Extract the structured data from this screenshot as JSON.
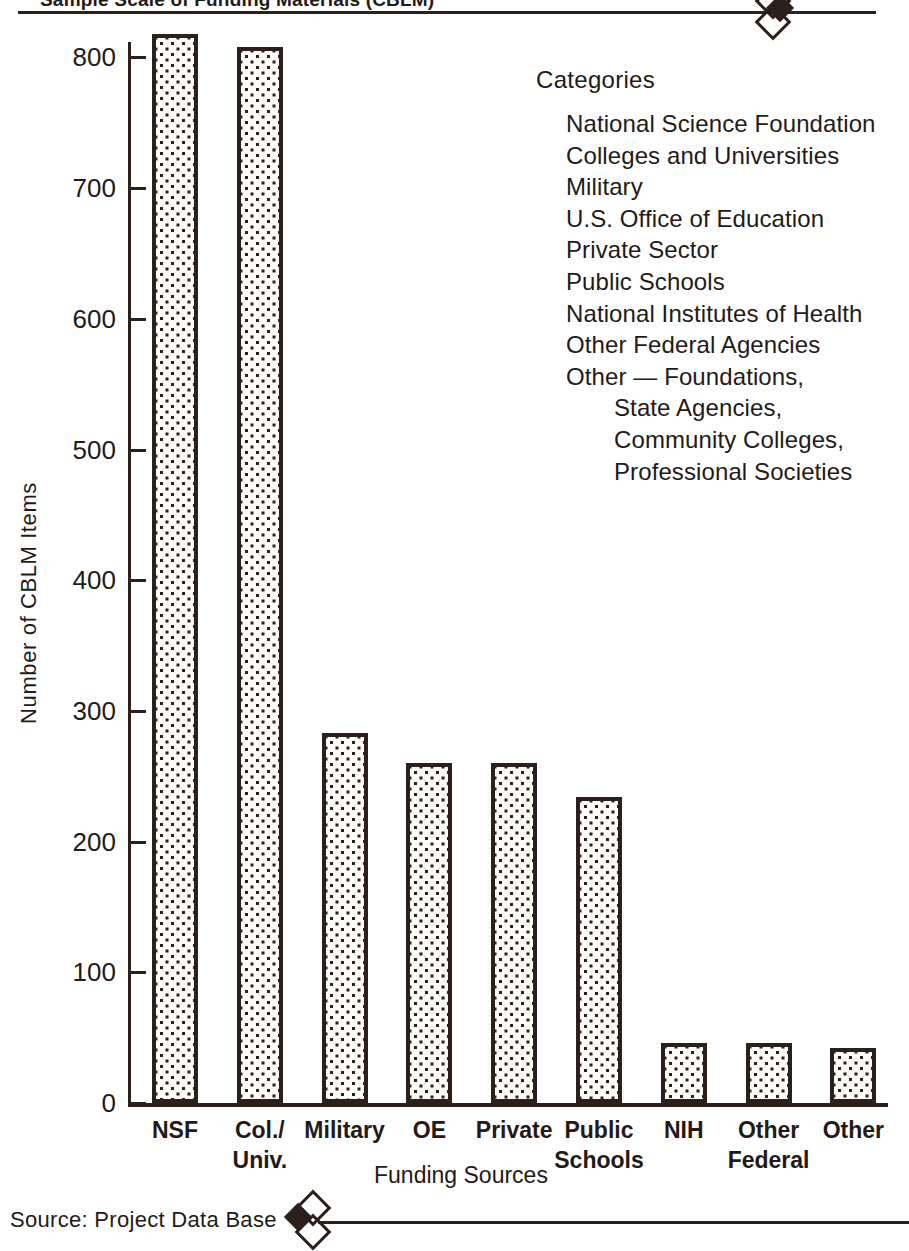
{
  "chart_data": {
    "type": "bar",
    "title": "Sample Scale of Funding Materials (CBLM)",
    "xlabel": "Funding Sources",
    "ylabel": "Number of CBLM Items",
    "ylim": [
      0,
      850
    ],
    "yticks": [
      0,
      100,
      200,
      300,
      400,
      500,
      600,
      700,
      800
    ],
    "ytick_labels": [
      "0",
      "100",
      "200",
      "300",
      "400",
      "500",
      "600",
      "700",
      "800"
    ],
    "grid": false,
    "legend_position": "upper-right",
    "categories": [
      "NSF",
      "Col./\nUniv.",
      "Military",
      "OE",
      "Private",
      "Public\nSchools",
      "NIH",
      "Other\nFederal",
      "Other"
    ],
    "values": [
      818,
      808,
      283,
      260,
      260,
      234,
      46,
      46,
      42
    ],
    "bar_fill": "dotted-halftone",
    "bar_edge_color": "#2b201c"
  },
  "axis": {
    "y_title": "Number of CBLM Items",
    "x_title": "Funding Sources",
    "y_ticks": [
      {
        "label": "800",
        "value": 800
      },
      {
        "label": "700",
        "value": 700
      },
      {
        "label": "600",
        "value": 600
      },
      {
        "label": "500",
        "value": 500
      },
      {
        "label": "400",
        "value": 400
      },
      {
        "label": "300",
        "value": 300
      },
      {
        "label": "200",
        "value": 200
      },
      {
        "label": "100",
        "value": 100
      },
      {
        "label": "0",
        "value": 0
      }
    ],
    "x_labels": [
      {
        "line1": "NSF",
        "line2": ""
      },
      {
        "line1": "Col./",
        "line2": "Univ."
      },
      {
        "line1": "Military",
        "line2": ""
      },
      {
        "line1": "OE",
        "line2": ""
      },
      {
        "line1": "Private",
        "line2": ""
      },
      {
        "line1": "Public",
        "line2": "Schools"
      },
      {
        "line1": "NIH",
        "line2": ""
      },
      {
        "line1": "Other",
        "line2": "Federal"
      },
      {
        "line1": "Other",
        "line2": ""
      }
    ]
  },
  "legend": {
    "title": "Categories",
    "items": [
      {
        "text": "National Science Foundation",
        "indent": false
      },
      {
        "text": "Colleges and Universities",
        "indent": false
      },
      {
        "text": "Military",
        "indent": false
      },
      {
        "text": "U.S. Office of Education",
        "indent": false
      },
      {
        "text": "Private Sector",
        "indent": false
      },
      {
        "text": "Public Schools",
        "indent": false
      },
      {
        "text": "National Institutes of Health",
        "indent": false
      },
      {
        "text": "Other Federal Agencies",
        "indent": false
      },
      {
        "text": "Other — Foundations,",
        "indent": false
      },
      {
        "text": "State Agencies,",
        "indent": true
      },
      {
        "text": "Community Colleges,",
        "indent": true
      },
      {
        "text": "Professional Societies",
        "indent": true
      }
    ]
  },
  "source": {
    "text": "Source:  Project Data Base"
  },
  "colors": {
    "ink": "#2b201c",
    "paper": "#ffffff"
  }
}
